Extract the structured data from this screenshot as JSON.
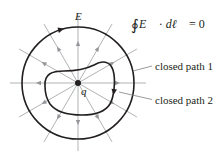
{
  "diagram": {
    "equation": "∮E⃗ · dl⃗ = 0",
    "equation_parts": {
      "integral": "∮",
      "field": "E⃗",
      "dot": " · ",
      "element": "dℓ⃗",
      "rhs": " = 0"
    },
    "labels": {
      "field": "E",
      "charge": "q",
      "path1": "closed path 1",
      "path2": "closed path 2"
    },
    "geometry": {
      "charge_center": [
        78,
        83
      ],
      "outer_circle_radius": 56,
      "radial_line_length": 68,
      "radial_line_count": 12,
      "field_arrow_radius": 42,
      "field_direction": "outward"
    },
    "colors": {
      "path": "#231f20",
      "field_lines": "#a7a9ac",
      "field_arrows": "#939598",
      "text": "#231f20"
    }
  }
}
